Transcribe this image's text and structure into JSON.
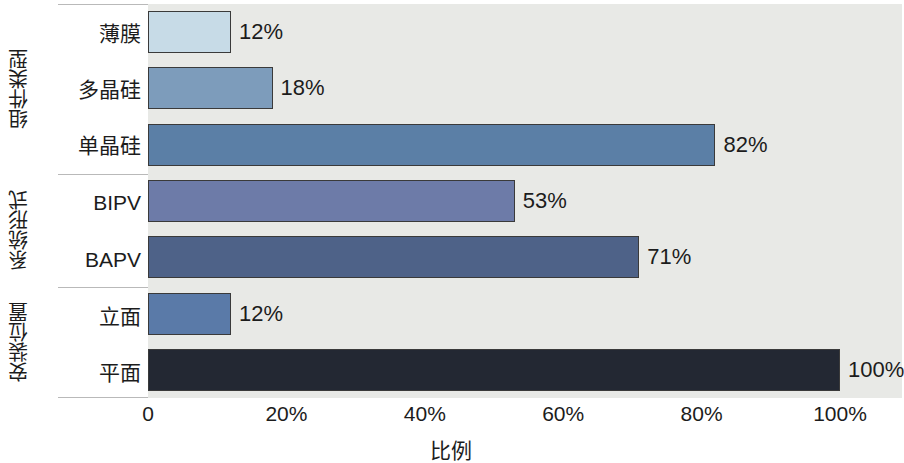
{
  "chart_data": {
    "type": "bar",
    "orientation": "horizontal",
    "title": "",
    "xlabel": "比例",
    "ylabel": "",
    "xlim": [
      0,
      100
    ],
    "grid": false,
    "legend": "none",
    "xticks": [
      "0",
      "20%",
      "40%",
      "60%",
      "80%",
      "100%"
    ],
    "xtick_values": [
      0,
      20,
      40,
      60,
      80,
      100
    ],
    "groups": [
      {
        "name": "组件类型",
        "categories": [
          "薄膜",
          "多晶硅",
          "单晶硅"
        ],
        "values": [
          12,
          18,
          82
        ],
        "labels": [
          "12%",
          "18%",
          "82%"
        ],
        "colors": [
          "#c7dbe7",
          "#7d9cbb",
          "#5b7fa6"
        ]
      },
      {
        "name": "系统形式",
        "categories": [
          "BIPV",
          "BAPV"
        ],
        "values": [
          53,
          71
        ],
        "labels": [
          "53%",
          "71%"
        ],
        "colors": [
          "#6d7ba8",
          "#4e6288"
        ]
      },
      {
        "name": "安装位置",
        "categories": [
          "立面",
          "平面"
        ],
        "values": [
          12,
          100
        ],
        "labels": [
          "12%",
          "100%"
        ],
        "colors": [
          "#5a7aa8",
          "#232833"
        ]
      }
    ],
    "plot_background": "#e8e9e6",
    "figure_background": "#ffffff",
    "bar_edge_color": "#3a3a3a"
  }
}
